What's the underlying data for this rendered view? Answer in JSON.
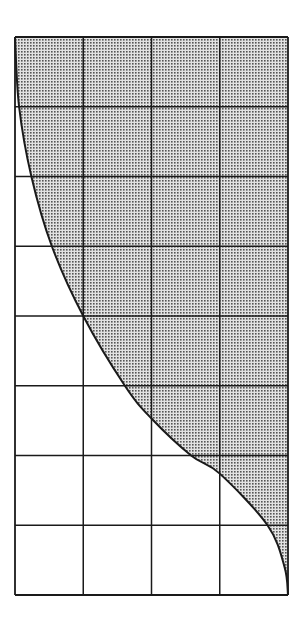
{
  "figure": {
    "grid": {
      "columns": 4,
      "rows": 8
    },
    "colors": {
      "line": "#1a1a1a",
      "shade_dot": "#555555",
      "shade_bg": "#e2e2e2",
      "background": "#ffffff"
    },
    "curve_points": [
      [
        0.0,
        0.0
      ],
      [
        0.06,
        1.0
      ],
      [
        0.24,
        2.0
      ],
      [
        0.54,
        3.0
      ],
      [
        1.0,
        4.0
      ],
      [
        1.61,
        5.0
      ],
      [
        2.0,
        5.47
      ],
      [
        2.58,
        6.0
      ],
      [
        3.0,
        6.26
      ],
      [
        3.7,
        7.0
      ],
      [
        3.95,
        7.6
      ],
      [
        4.0,
        8.0
      ]
    ],
    "shaded_side": "above-right"
  }
}
